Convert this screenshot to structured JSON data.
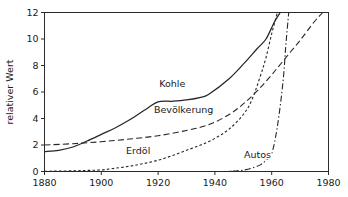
{
  "chart_data": {
    "type": "line",
    "title": "",
    "xlabel": "",
    "ylabel": "relativer Wert",
    "xlim": [
      1880,
      1980
    ],
    "ylim": [
      0,
      12
    ],
    "grid": false,
    "legend_position": "inline-labels",
    "xticks": [
      1880,
      1900,
      1920,
      1940,
      1960,
      1980
    ],
    "xtick_labels": [
      "1880",
      "1900",
      "1920",
      "1940",
      "1960",
      "1980"
    ],
    "yticks": [
      0,
      2,
      4,
      6,
      8,
      10,
      12
    ],
    "ytick_labels": [
      "0",
      "2",
      "4",
      "6",
      "8",
      "10",
      "12"
    ],
    "series": [
      {
        "name": "Kohle",
        "style": "solid",
        "label_text": "Kohle",
        "label_x": 1925,
        "label_y": 6.4,
        "x": [
          1880,
          1885,
          1890,
          1895,
          1900,
          1905,
          1910,
          1915,
          1920,
          1925,
          1930,
          1935,
          1938,
          1945,
          1950,
          1955,
          1958,
          1961,
          1963
        ],
        "y": [
          1.5,
          1.6,
          1.85,
          2.3,
          2.8,
          3.3,
          3.9,
          4.6,
          5.25,
          5.3,
          5.4,
          5.6,
          5.85,
          7.0,
          8.1,
          9.3,
          10.0,
          11.3,
          12.0
        ]
      },
      {
        "name": "Bevölkerung",
        "style": "dashed",
        "label_text": "Bevölkerung",
        "label_x": 1929,
        "label_y": 4.45,
        "x": [
          1880,
          1890,
          1900,
          1910,
          1920,
          1930,
          1938,
          1945,
          1950,
          1955,
          1960,
          1965,
          1970,
          1975,
          1978
        ],
        "y": [
          2.0,
          2.1,
          2.25,
          2.45,
          2.7,
          3.1,
          3.55,
          4.3,
          5.1,
          6.1,
          7.3,
          8.6,
          9.9,
          11.3,
          12.0
        ]
      },
      {
        "name": "Erdöl",
        "style": "dotted",
        "label_text": "Erdöl",
        "label_x": 1913,
        "label_y": 1.35,
        "x": [
          1880,
          1890,
          1895,
          1900,
          1905,
          1910,
          1915,
          1920,
          1925,
          1930,
          1935,
          1940,
          1945,
          1950,
          1953,
          1956,
          1958,
          1960,
          1962
        ],
        "y": [
          0.02,
          0.05,
          0.08,
          0.12,
          0.25,
          0.4,
          0.6,
          0.85,
          1.2,
          1.6,
          2.0,
          2.5,
          3.2,
          4.3,
          5.4,
          7.2,
          8.6,
          10.4,
          12.0
        ]
      },
      {
        "name": "Autos",
        "style": "dashdot",
        "label_text": "Autos",
        "label_x": 1955,
        "label_y": 1.05,
        "x": [
          1880,
          1940,
          1945,
          1948,
          1950,
          1953,
          1956,
          1958,
          1960,
          1962,
          1964,
          1965,
          1966
        ],
        "y": [
          0.0,
          0.0,
          0.02,
          0.05,
          0.1,
          0.25,
          0.5,
          0.85,
          1.35,
          3.4,
          6.8,
          9.6,
          12.0
        ]
      }
    ]
  },
  "axes": {
    "y_axis_title": "relativer Wert"
  }
}
